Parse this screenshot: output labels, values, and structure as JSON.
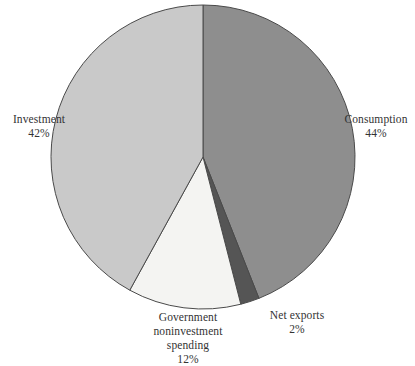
{
  "chart_data": {
    "type": "pie",
    "title": "",
    "subtitle": "",
    "legend_position": "none",
    "grid": false,
    "start_angle_deg": 0,
    "direction": "clockwise",
    "categories": [
      "Consumption",
      "Net exports",
      "Government noninvestment spending",
      "Investment"
    ],
    "values": [
      44,
      2,
      12,
      42
    ],
    "value_unit": "%",
    "slices": [
      {
        "label": "Consumption",
        "value": 44,
        "value_text": "44%",
        "color": "#8e8e8e"
      },
      {
        "label": "Net exports",
        "value": 2,
        "value_text": "2%",
        "color": "#555555"
      },
      {
        "label": "Government noninvestment spending",
        "value": 12,
        "value_text": "12%",
        "color": "#f4f4f2"
      },
      {
        "label": "Investment",
        "value": 42,
        "value_text": "42%",
        "color": "#c9c9c9"
      }
    ]
  },
  "labels": {
    "investment": {
      "name": "Investment",
      "value": "42%"
    },
    "consumption": {
      "name": "Consumption",
      "value": "44%"
    },
    "government": {
      "line1": "Government",
      "line2": "noninvestment",
      "line3": "spending",
      "value": "12%"
    },
    "net_exports": {
      "name": "Net exports",
      "value": "2%"
    }
  },
  "colors": {
    "background": "#ffffff",
    "text": "#333333",
    "outline": "#4a4a4a",
    "consumption": "#8e8e8e",
    "net_exports": "#555555",
    "government": "#f4f4f2",
    "investment": "#c9c9c9"
  }
}
